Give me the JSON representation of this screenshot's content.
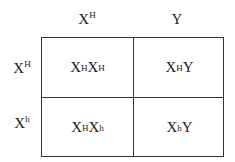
{
  "diagram": {
    "type": "punnett-square",
    "column_headers": [
      {
        "base": "X",
        "sup": "H"
      },
      {
        "base": "Y",
        "sup": ""
      }
    ],
    "row_headers": [
      {
        "base": "X",
        "sup": "H"
      },
      {
        "base": "X",
        "sup": "h"
      }
    ],
    "cells": [
      [
        {
          "a": "X",
          "a_sup": "H",
          "b": "X",
          "b_sup": "H"
        },
        {
          "a": "X",
          "a_sup": "H",
          "b": "Y",
          "b_sup": ""
        }
      ],
      [
        {
          "a": "X",
          "a_sup": "H",
          "b": "X",
          "b_sup": "h"
        },
        {
          "a": "X",
          "a_sup": "h",
          "b": "Y",
          "b_sup": ""
        }
      ]
    ]
  }
}
